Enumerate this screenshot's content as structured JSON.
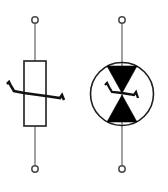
{
  "diagram": {
    "background_color": "#ffffff",
    "width": 168,
    "height": 192,
    "symbols": [
      {
        "id": "varistor-rect",
        "name": "Varistor (VDR) — rectangular body",
        "type": "varistor",
        "label": "",
        "body_shape": "rectangle",
        "marking": "diagonal-zigzag-slash",
        "stroke_color": "#2b2b2b",
        "marking_color": "#111111",
        "lead_color": "#8a8a8a",
        "terminal_color": "#4a4a4a",
        "center_x": 35,
        "body": {
          "x": 24,
          "y": 61,
          "width": 22,
          "height": 65
        },
        "leads": {
          "top_y1": 23,
          "top_y2": 61,
          "bottom_y1": 126,
          "bottom_y2": 166
        },
        "terminals": [
          {
            "name": "terminal-top",
            "cx": 35,
            "cy": 20,
            "r": 3.2
          },
          {
            "name": "terminal-bottom",
            "cx": 35,
            "cy": 169,
            "r": 3.2
          }
        ],
        "slash_points": "7,84 9,82 11,86 14,91 24,93 46,96 60,98 62,95 64,100"
      },
      {
        "id": "varistor-diac",
        "name": "Bidirectional varistor / DIAC in circle",
        "type": "diac-varistor",
        "label": "",
        "body_shape": "circle",
        "marking": "filled-hourglass-with-zigzag",
        "stroke_color": "#1e1e1e",
        "marking_color": "#000000",
        "lead_color": "#8a8a8a",
        "terminal_color": "#4a4a4a",
        "center_x": 122,
        "circle": {
          "cx": 122,
          "cy": 94,
          "r": 31.5
        },
        "leads": {
          "top_y1": 23,
          "top_y2": 63,
          "bottom_y1": 126,
          "bottom_y2": 166
        },
        "terminals": [
          {
            "name": "terminal-top",
            "cx": 122,
            "cy": 20,
            "r": 3.2
          },
          {
            "name": "terminal-bottom",
            "cx": 122,
            "cy": 169,
            "r": 3.2
          }
        ],
        "triangle_upper": "107,66 137,66 122,93",
        "triangle_lower": "122,95 137,122 107,122",
        "zigzag_points": "105,85 107,83 109,87 112,92 122,93 134,95 136,92 138,98"
      }
    ]
  }
}
